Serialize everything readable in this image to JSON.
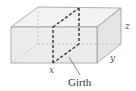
{
  "diagram": {
    "type": "rectangular-box",
    "labels": {
      "x": "x",
      "y": "y",
      "z": "z",
      "caption": "Girth"
    },
    "colors": {
      "face": "#ebebeb",
      "top_face": "#f2f2f2",
      "side_face": "#e4e4e4",
      "edge": "#9a9a9a",
      "hidden_edge": "#b5b5b5",
      "girth_line": "#333333"
    }
  }
}
